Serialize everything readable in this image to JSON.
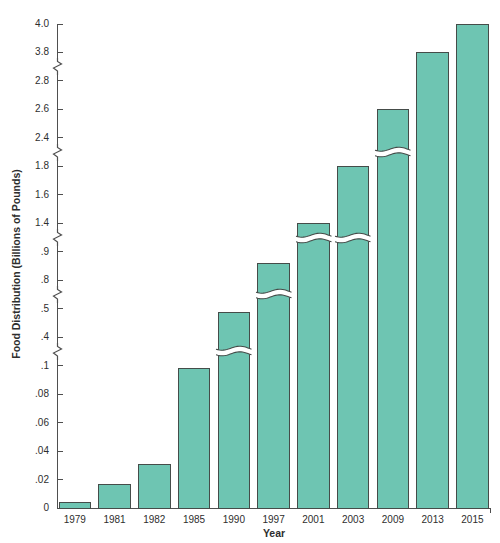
{
  "chart_data": {
    "type": "bar",
    "title": "",
    "xlabel": "Year",
    "ylabel": "Food Distribution (Billions of Pounds)",
    "categories": [
      "1979",
      "1981",
      "1982",
      "1985",
      "1990",
      "1997",
      "2001",
      "2003",
      "2009",
      "2013",
      "2015"
    ],
    "values": [
      0.004,
      0.017,
      0.031,
      0.098,
      0.49,
      0.86,
      1.4,
      1.8,
      2.6,
      3.8,
      4.0
    ],
    "y_tick_labels_top_to_bottom": [
      "4.0",
      "3.8",
      "2.8",
      "2.6",
      "2.4",
      "1.8",
      "1.6",
      "1.4",
      ".9",
      ".8",
      ".5",
      ".4",
      ".1",
      ".08",
      ".06",
      ".04",
      ".02",
      "0"
    ],
    "y_tick_values_top_to_bottom": [
      4.0,
      3.8,
      2.8,
      2.6,
      2.4,
      1.8,
      1.6,
      1.4,
      0.9,
      0.8,
      0.5,
      0.4,
      0.1,
      0.08,
      0.06,
      0.04,
      0.02,
      0
    ],
    "axis_break_pairs": [
      [
        3.8,
        2.8
      ],
      [
        2.4,
        1.8
      ],
      [
        1.4,
        0.9
      ],
      [
        0.8,
        0.5
      ],
      [
        0.4,
        0.1
      ]
    ],
    "bars_with_scale_break": [
      "1990",
      "1997",
      "2001",
      "2003",
      "2009"
    ],
    "grid": false,
    "legend": false,
    "colors": {
      "bar_fill": "#6ec5b2",
      "bar_border": "#454c49",
      "axis": "#4f4f4f",
      "text": "#2e2e2e",
      "background": "#ffffff"
    }
  }
}
